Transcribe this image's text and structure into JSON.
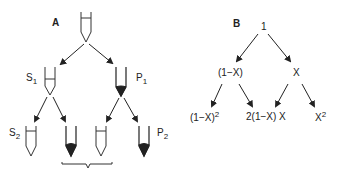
{
  "panel_a": {
    "label": "A",
    "nodes": {
      "s1": {
        "name": "S",
        "sub": "1"
      },
      "p1": {
        "name": "P",
        "sub": "1"
      },
      "s2": {
        "name": "S",
        "sub": "2"
      },
      "p2": {
        "name": "P",
        "sub": "2"
      }
    }
  },
  "panel_b": {
    "label": "B",
    "root": "1",
    "level1": {
      "left": "(1−X)",
      "right": "X"
    },
    "level2": {
      "left": {
        "base": "(1−X)",
        "sup": "2"
      },
      "middle": "2(1−X) X",
      "right": {
        "base": "X",
        "sup": "2"
      }
    }
  },
  "colors": {
    "ink": "#222222",
    "background": "#ffffff"
  }
}
